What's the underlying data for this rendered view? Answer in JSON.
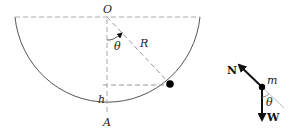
{
  "diagram": {
    "bowl": {
      "labels": {
        "center": "O",
        "bottom": "A",
        "radius": "R",
        "angle": "θ",
        "height": "h"
      }
    },
    "free_body": {
      "labels": {
        "normal": "N",
        "weight": "W",
        "mass": "m",
        "angle": "θ"
      }
    },
    "colors": {
      "line": "#555555",
      "dash": "#999999",
      "particle": "#000000"
    }
  }
}
